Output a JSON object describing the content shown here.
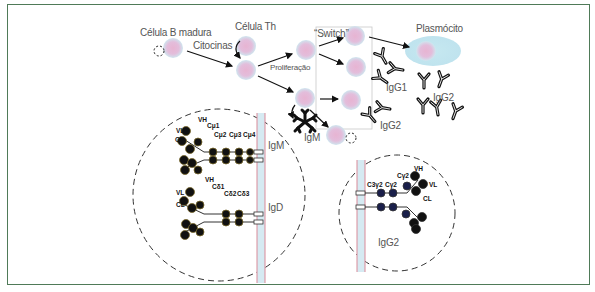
{
  "figure": {
    "frame_color": "#4f7a58",
    "cell_color": "#e6b8d4",
    "cell_halo_color": "#cfe6ef",
    "plasma_cytoplasm_color": "#bfe5ef",
    "membrane_color": "#d98a99",
    "membrane_fill": "#d6eaf2"
  },
  "labels": {
    "mature_b_cell": "Célula B madura",
    "th_cell": "Célula Th",
    "cytokines": "Citocinas",
    "proliferation": "Proliferação",
    "switch": "“Switch”",
    "plasma_cell": "Plasmócito",
    "igg1": "IgG1",
    "igg2_top_right": "IgG2",
    "igg2_middle": "IgG2",
    "igm_secreted": "IgM"
  },
  "igm_igd_panel": {
    "igm_label": "IgM",
    "igd_label": "IgD",
    "igm_domains": {
      "vh": "VH",
      "vl": "VL",
      "cl": "CL",
      "c1": "Cμ1",
      "c2": "Cμ2",
      "c3": "Cμ3",
      "c4": "Cμ4"
    },
    "igd_domains": {
      "vh": "VH",
      "vl": "VL",
      "cl": "CL",
      "c1": "Cδ1",
      "c2": "Cδ2",
      "c3": "Cδ3"
    }
  },
  "igg2_panel": {
    "label": "IgG2",
    "domains": {
      "vh": "VH",
      "vl": "VL",
      "cl": "CL",
      "c1": "Cγ2",
      "c2": "Cγ2",
      "c3": "C3γ2"
    }
  }
}
